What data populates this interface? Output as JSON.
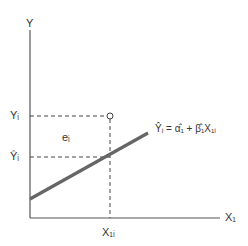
{
  "diagram": {
    "y_axis_label": "Y",
    "x_axis_label": "X₁",
    "observed_label": "Yᵢ",
    "fitted_label": "Ŷᵢ",
    "residual_label": "eᵢ",
    "x_value_label": "X₁ᵢ",
    "equation": "Ŷᵢ = α̂₁ + β̂₁X₁ᵢ",
    "colors": {
      "axes": "#555555",
      "regression_line": "#666666",
      "dashed": "#444444",
      "text": "#333333"
    }
  }
}
